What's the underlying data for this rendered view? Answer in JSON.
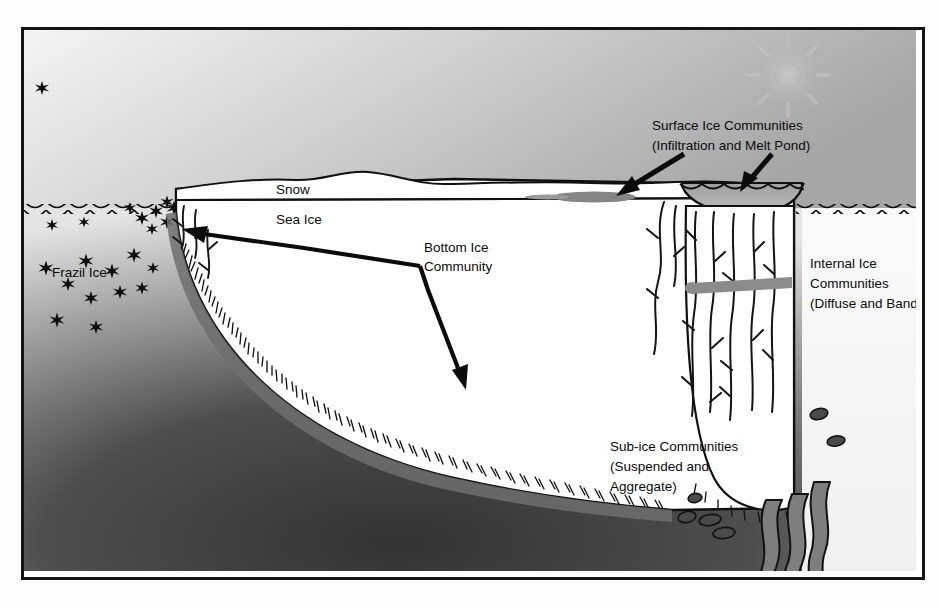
{
  "figure": {
    "kind": "sea-ice-habitat-cross-section",
    "frame_color": "#141414",
    "background_color": "#ffffff"
  },
  "labels": {
    "snow": "Snow",
    "sea_ice": "Sea Ice",
    "frazil_ice": "Frazil Ice",
    "bottom_ice_l1": "Bottom Ice",
    "bottom_ice_l2": "Community",
    "surface_l1": "Surface Ice Communities",
    "surface_l2": "(Infiltration and  Melt Pond)",
    "internal_l1": "Internal Ice",
    "internal_l2": "Communities",
    "internal_l3": "(Diffuse and Band)",
    "subice_l1": "Sub-ice Communities",
    "subice_l2": "(Suspended and",
    "subice_l3": "Aggregate)"
  },
  "palette": {
    "sky_light": "#f2f2f2",
    "sky_mid": "#c9c9c9",
    "sky_dark": "#a9a9a9",
    "water_shallow": "#bdbdbd",
    "water_deep": "#3a3a3a",
    "water_right": "#f4f4f4",
    "ice_fill": "#ffffff",
    "snow_fill": "#ffffff",
    "gray_feature": "#8d8d8d",
    "ink": "#0b0b0b"
  },
  "features": {
    "melt_pond": "gray ellipse depression on floe surface at right",
    "infiltration_layer": "gray lens at snow / sea-ice interface",
    "internal_band": "horizontal gray band inside right ice keel",
    "brine_channels": "dark branching channels through right ice keel",
    "bottom_bristles": "dense short strands along underside of ice",
    "suspended_particles": "small dark ellipses in water below ice",
    "aggregate_ribbons": "wavy gray ribbons hanging below right keel",
    "frazil_stars": "asterisk shapes in water left of floe",
    "sun_watermark": "faint sun / compass rose in upper right sky"
  }
}
